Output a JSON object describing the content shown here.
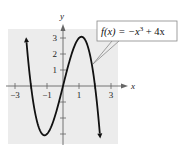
{
  "chart_data": {
    "type": "line",
    "title": "",
    "function_label": "f(x) = −x³ + 4x",
    "function_label_parts": {
      "lhs": "f(x) = −x",
      "exp": "3",
      "rhs": " + 4x"
    },
    "xlabel": "x",
    "ylabel": "y",
    "xlim": [
      -3.4,
      3.4
    ],
    "ylim": [
      -3.6,
      3.6
    ],
    "x_ticks": [
      -3,
      -2,
      -1,
      0,
      1,
      2,
      3
    ],
    "x_tick_labels": [
      "-3",
      "-1",
      "1",
      "3"
    ],
    "x_tick_label_values": [
      -3,
      -1,
      1,
      3
    ],
    "y_ticks": [
      -3,
      -2,
      -1,
      1,
      2,
      3
    ],
    "y_tick_labels": [
      "1",
      "2",
      "3"
    ],
    "y_tick_label_values": [
      1,
      2,
      3
    ],
    "grid": false,
    "shaded_background": true,
    "series": [
      {
        "name": "f(x) = -x^3 + 4x",
        "x": [
          -2.3,
          -2.0,
          -1.5,
          -1.15,
          -1.0,
          -0.5,
          0.0,
          0.5,
          1.0,
          1.15,
          1.5,
          2.0,
          2.3
        ],
        "y": [
          2.97,
          0.0,
          -2.63,
          -3.08,
          -3.0,
          -1.88,
          0.0,
          1.88,
          3.0,
          3.08,
          2.63,
          0.0,
          -2.97
        ]
      }
    ],
    "annotations": [
      {
        "text": "f(x) = −x³ + 4x",
        "points_to": [
          1.9,
          0.9
        ]
      }
    ]
  },
  "colors": {
    "background": "#ffffff",
    "plot_shade": "#ececec",
    "curve": "#111111",
    "axis": "#666666",
    "callout_border": "#888888"
  }
}
